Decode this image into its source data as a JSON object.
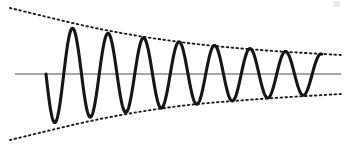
{
  "figure": {
    "title": "",
    "background_color": "#ffffff",
    "width": 347,
    "height": 145
  },
  "axis": {
    "name": "horizontal-zero-axis",
    "color": "#8a8a8a",
    "stroke_width": 1.6,
    "y": 74,
    "x_start": 15,
    "x_end": 341
  },
  "wave": {
    "color": "#161616",
    "stroke_width": 3.1,
    "style": "solid"
  },
  "envelope": {
    "color": "#1d1d1d",
    "stroke_width": 1.9,
    "style": "dotted",
    "upper_label": "",
    "lower_label": ""
  },
  "artifact": {
    "present": true,
    "description": "faint-scan-speck-top-right"
  },
  "chart_data": {
    "type": "line",
    "title": "",
    "subtitle": "",
    "xlabel": "",
    "ylabel": "",
    "grid": false,
    "legend": "none",
    "xlim": [
      0,
      347
    ],
    "ylim": [
      145,
      0
    ],
    "axis_y_pixel": 74,
    "baseline_value": 0,
    "series": [
      {
        "name": "damped-oscillation",
        "style": "solid",
        "color": "#161616",
        "model": "y = A0 * exp(-k * x) * sin(2*pi*x/period + phase)",
        "amplitude_initial_px": 50,
        "amplitude_final_px": 20,
        "period_px": 35.5,
        "x_start": 46,
        "x_end": 322,
        "phase": "starts at zero descending",
        "extrema": [
          {
            "type": "trough",
            "x": 55,
            "y": 124
          },
          {
            "type": "peak",
            "x": 71,
            "y": 27
          },
          {
            "type": "trough",
            "x": 90,
            "y": 121
          },
          {
            "type": "peak",
            "x": 107,
            "y": 31
          },
          {
            "type": "trough",
            "x": 125,
            "y": 117
          },
          {
            "type": "peak",
            "x": 143,
            "y": 36
          },
          {
            "type": "trough",
            "x": 160,
            "y": 112
          },
          {
            "type": "peak",
            "x": 177,
            "y": 41
          },
          {
            "type": "trough",
            "x": 193,
            "y": 108
          },
          {
            "type": "peak",
            "x": 212,
            "y": 45
          },
          {
            "type": "trough",
            "x": 228,
            "y": 104
          },
          {
            "type": "peak",
            "x": 244,
            "y": 48
          },
          {
            "type": "trough",
            "x": 261,
            "y": 100
          },
          {
            "type": "peak",
            "x": 277,
            "y": 51
          },
          {
            "type": "trough",
            "x": 294,
            "y": 97
          },
          {
            "type": "peak",
            "x": 311,
            "y": 55
          }
        ]
      },
      {
        "name": "upper-envelope",
        "style": "dotted",
        "color": "#1d1d1d",
        "points": [
          [
            10,
            8
          ],
          [
            100,
            29
          ],
          [
            180,
            42
          ],
          [
            260,
            50
          ],
          [
            341,
            55
          ]
        ]
      },
      {
        "name": "lower-envelope",
        "style": "dotted",
        "color": "#1d1d1d",
        "points": [
          [
            10,
            140
          ],
          [
            100,
            119
          ],
          [
            180,
            106
          ],
          [
            260,
            99
          ],
          [
            341,
            94
          ]
        ]
      }
    ]
  }
}
